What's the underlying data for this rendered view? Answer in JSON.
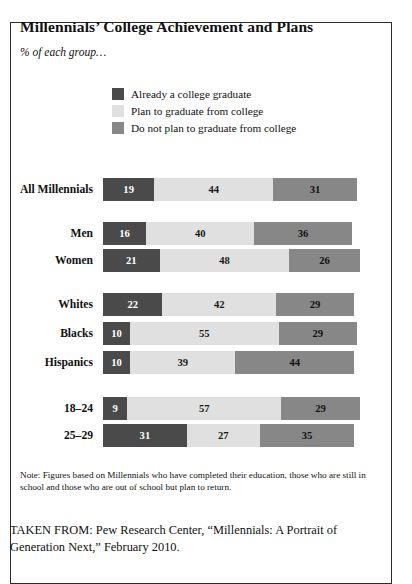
{
  "title": "Millennials’ College Achievement and Plans",
  "subtitle": "% of each group…",
  "legend": [
    {
      "label": "Already a college graduate",
      "color": "#4a4a4a",
      "key": "grad"
    },
    {
      "label": "Plan to graduate from college",
      "color": "#e0e0e0",
      "key": "plan"
    },
    {
      "label": "Do not plan to graduate from college",
      "color": "#878787",
      "key": "noplan"
    }
  ],
  "note": "Note: Figures based on Millennials who have completed their education, those who are still in school and those who are out of school but plan to return.",
  "source": "TAKEN FROM: Pew Research Center, “Millennials: A Portrait of Generation Next,” February 2010.",
  "chart_data": {
    "type": "bar",
    "orientation": "horizontal",
    "stacked": true,
    "title": "Millennials’ College Achievement and Plans",
    "subtitle": "% of each group…",
    "xlabel": "",
    "ylabel": "",
    "xlim": [
      0,
      94
    ],
    "grid": false,
    "legend_position": "top-center",
    "value_unit": "percent",
    "categories": [
      "All Millennials",
      "Men",
      "Women",
      "Whites",
      "Blacks",
      "Hispanics",
      "18–24",
      "25–29"
    ],
    "series": [
      {
        "name": "Already a college graduate",
        "color": "#4a4a4a",
        "values": [
          19,
          16,
          21,
          22,
          10,
          10,
          9,
          31
        ]
      },
      {
        "name": "Plan to graduate from college",
        "color": "#e0e0e0",
        "values": [
          44,
          40,
          48,
          42,
          55,
          39,
          57,
          27
        ]
      },
      {
        "name": "Do not plan to graduate from college",
        "color": "#878787",
        "values": [
          31,
          36,
          26,
          29,
          29,
          44,
          29,
          35
        ]
      }
    ],
    "groups": [
      {
        "name": "overall",
        "categories": [
          "All Millennials"
        ]
      },
      {
        "name": "gender",
        "categories": [
          "Men",
          "Women"
        ]
      },
      {
        "name": "race",
        "categories": [
          "Whites",
          "Blacks",
          "Hispanics"
        ]
      },
      {
        "name": "age",
        "categories": [
          "18–24",
          "25–29"
        ]
      }
    ]
  }
}
